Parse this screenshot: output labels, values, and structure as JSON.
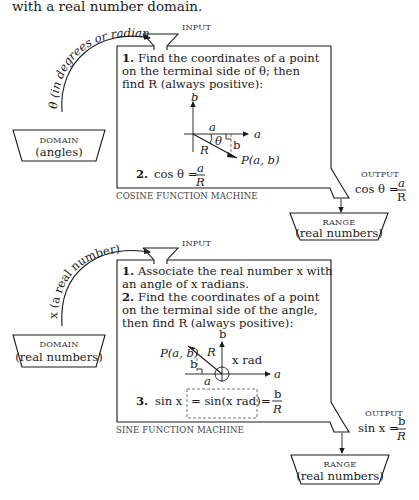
{
  "intro": {
    "text": "with a real number domain."
  },
  "cosine_machine": {
    "domain_arrow_label": "θ (in degrees or radians)",
    "input_label": "INPUT",
    "domain": {
      "title": "DOMAIN",
      "subtitle": "(angles)"
    },
    "step1": {
      "number": "1.",
      "lines": [
        "Find the coordinates of a point",
        "on the terminal side of θ; then",
        "find R (always positive):"
      ]
    },
    "figure": {
      "axis_b": "b",
      "axis_a": "a",
      "seg_a": "a",
      "angle": "θ",
      "radius": "R",
      "seg_b": "b",
      "point": "P(a, b)"
    },
    "step2": {
      "number": "2.",
      "lhs": "cos θ =",
      "num": "a",
      "den": "R"
    },
    "caption": "COSINE FUNCTION MACHINE",
    "output_label": "OUTPUT",
    "output": {
      "lhs": "cos θ =",
      "num": "a",
      "den": "R"
    },
    "range": {
      "title": "RANGE",
      "subtitle": "(real numbers)"
    }
  },
  "sine_machine": {
    "domain_arrow_label": "x (a real number)",
    "input_label": "INPUT",
    "domain": {
      "title": "DOMAIN",
      "subtitle": "(real numbers)"
    },
    "step1": {
      "number": "1.",
      "lines": [
        "Associate the real number x with",
        "an angle of x radians."
      ]
    },
    "step2": {
      "number": "2.",
      "lines": [
        "Find the coordinates of a point",
        "on the terminal side of the angle,",
        "then find R (always positive):"
      ]
    },
    "figure": {
      "axis_b": "b",
      "axis_a": "a",
      "point": "P(a, b)",
      "radius": "R",
      "seg_b": "b",
      "seg_a": "a",
      "angle": "x rad"
    },
    "step3": {
      "number": "3.",
      "lhs": "sin x",
      "boxed": "= sin(x rad)",
      "eq": "=",
      "num": "b",
      "den": "R"
    },
    "caption": "SINE FUNCTION MACHINE",
    "output_label": "OUTPUT",
    "output": {
      "lhs": "sin x =",
      "num": "b",
      "den": "R"
    },
    "range": {
      "title": "RANGE",
      "subtitle": "(real numbers)"
    }
  }
}
